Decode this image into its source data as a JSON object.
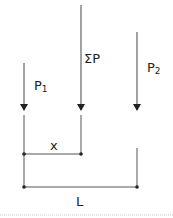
{
  "diagram": {
    "colors": {
      "line": "#333333",
      "text": "#222222",
      "rule": "#cccccc"
    },
    "forces": [
      {
        "id": "P1",
        "label_main": "P",
        "label_sub": "1",
        "x": 24,
        "y_top": 63
      },
      {
        "id": "sumP",
        "label_main": "ΣP",
        "label_sub": "",
        "x": 81,
        "y_top": 5
      },
      {
        "id": "P2",
        "label_main": "P",
        "label_sub": "2",
        "x": 137,
        "y_top": 32
      }
    ],
    "dimensions": [
      {
        "id": "x",
        "label": "x",
        "from_x": 24,
        "to_x": 81,
        "y": 154
      },
      {
        "id": "L",
        "label": "L",
        "from_x": 24,
        "to_x": 137,
        "y": 187
      }
    ]
  }
}
